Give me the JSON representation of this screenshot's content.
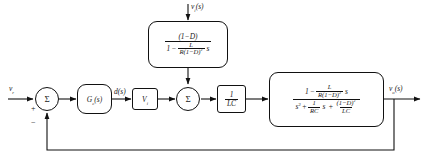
{
  "diagram": {
    "signals": {
      "reference_input": "v",
      "reference_sub": "r",
      "disturbance_input": "v",
      "disturbance_sub": "i",
      "disturbance_arg": "(s)",
      "duty_signal": "d",
      "duty_arg": "(s)",
      "output": "v",
      "output_sub": "o",
      "output_arg": "(s)"
    },
    "summers": [
      {
        "glyph": "Σ",
        "plus": "+",
        "minus": "−"
      },
      {
        "glyph": "Σ"
      }
    ],
    "blocks": {
      "controller": {
        "name": "G",
        "sub": "c",
        "arg": "(s)"
      },
      "input_gain": {
        "name": "V",
        "sub": "i"
      },
      "lc_gain": {
        "numerator": "1",
        "denominator": "LC"
      },
      "feedforward": {
        "numerator": "(1−D)",
        "den_lead": "1",
        "den_op": "−",
        "den_frac_num": "L",
        "den_frac_den_r": "R",
        "den_frac_den_paren": "(1−D)",
        "den_frac_den_exp": "2",
        "den_tail_s": "s"
      },
      "plant": {
        "num_lead": "1",
        "num_op": "−",
        "num_frac_num": "L",
        "num_frac_den_r": "R",
        "num_frac_den_paren": "(1−D)",
        "num_frac_den_exp": "2",
        "num_tail_s": "s",
        "den_s2": "s",
        "den_s2_exp": "2",
        "den_op1": "+",
        "den_f1_num": "1",
        "den_f1_den": "RC",
        "den_f1_tail": "s",
        "den_op2": "+",
        "den_f2_num": "(1−D)",
        "den_f2_num_exp": "2",
        "den_f2_den": "LC"
      }
    },
    "colors": {
      "line": "#111111",
      "background": "#ffffff"
    }
  }
}
